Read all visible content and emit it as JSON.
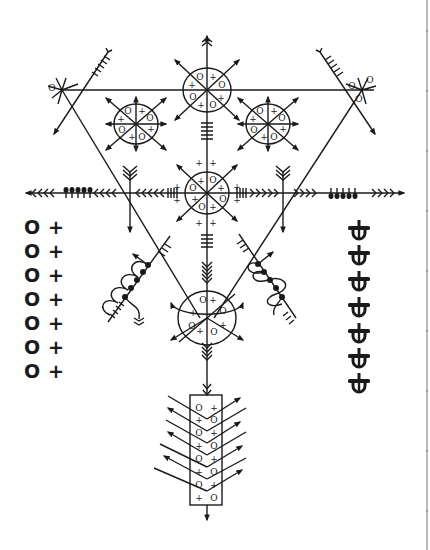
{
  "diagram": {
    "title": "",
    "colors": {
      "ink": "#1a1a1a",
      "background": "#ffffff",
      "page_edge": "#bbbbbb"
    },
    "circle_symbols": {
      "ring": "O",
      "cross": "+"
    },
    "left_column": {
      "rows": [
        {
          "a": "O",
          "b": "+"
        },
        {
          "a": "O",
          "b": "+"
        },
        {
          "a": "O",
          "b": "+"
        },
        {
          "a": "O",
          "b": "+"
        },
        {
          "a": "O",
          "b": "+"
        },
        {
          "a": "O",
          "b": "+"
        },
        {
          "a": "O",
          "b": "+"
        }
      ]
    },
    "right_column": {
      "glyph": "crossed-loop-glyph",
      "count": 7
    },
    "circles": {
      "top": {
        "labels": [
          "O",
          "+",
          "O",
          "+",
          "O",
          "+",
          "O",
          "+"
        ]
      },
      "upper_left": {
        "labels": [
          "O",
          "+",
          "O",
          "+",
          "O",
          "+",
          "O",
          "+"
        ]
      },
      "upper_right": {
        "labels": [
          "O",
          "+",
          "O",
          "+",
          "O",
          "+",
          "O",
          "+"
        ]
      },
      "center": {
        "labels": [
          "O",
          "+",
          "O",
          "+",
          "O",
          "+",
          "O",
          "+"
        ]
      },
      "bottom": {
        "labels": [
          "O",
          "+",
          "O",
          "+",
          "O",
          "+",
          "O",
          "+"
        ]
      }
    },
    "bottom_box": {
      "left": [
        "O",
        "+",
        "O",
        "+",
        "O",
        "+",
        "O",
        "+"
      ],
      "right": [
        "+",
        "O",
        "+",
        "O",
        "+",
        "O",
        "+",
        "O"
      ]
    }
  }
}
